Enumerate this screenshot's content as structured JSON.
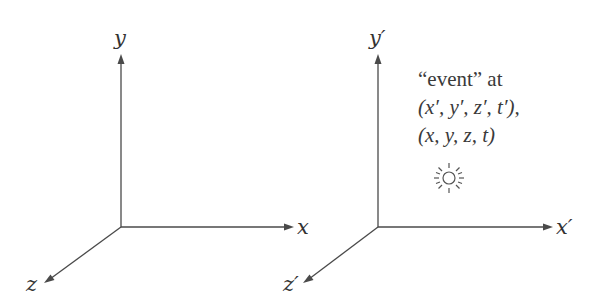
{
  "frames": {
    "unprimed": {
      "x_label": "x",
      "y_label": "y",
      "z_label": "z"
    },
    "primed": {
      "x_label": "x′",
      "y_label": "y′",
      "z_label": "z′"
    }
  },
  "event": {
    "line1": "“event” at",
    "line2": "(x′, y′, z′, t′),",
    "line3": "(x, y, z, t)",
    "icon": "sun-icon"
  },
  "colors": {
    "axis": "#4a4a4a",
    "text": "#333333",
    "background": "#ffffff"
  }
}
